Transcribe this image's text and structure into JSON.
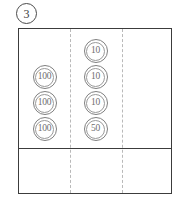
{
  "worksheet": {
    "problem_number": "3",
    "columns": [
      {
        "name": "hundreds",
        "coins": [
          {
            "value": "100"
          },
          {
            "value": "100"
          },
          {
            "value": "100"
          }
        ]
      },
      {
        "name": "tens",
        "coins": [
          {
            "value": "10"
          },
          {
            "value": "10"
          },
          {
            "value": "10"
          },
          {
            "value": "50"
          }
        ]
      },
      {
        "name": "ones",
        "coins": []
      }
    ],
    "colors": {
      "box_border": "#3c3c3c",
      "dashed_divider": "#b9b9b9",
      "coin_outline": "#808080",
      "coin_text": "#6e6e6e",
      "badge_border": "#4a4a4a"
    }
  }
}
